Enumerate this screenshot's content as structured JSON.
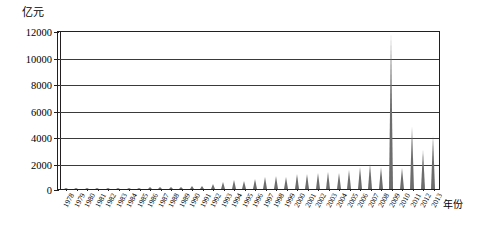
{
  "chart_data": {
    "type": "bar",
    "title": "",
    "xlabel": "年份",
    "ylabel": "亿元",
    "ylim": [
      0,
      12000
    ],
    "ytick_values": [
      0,
      2000,
      4000,
      6000,
      8000,
      10000,
      12000
    ],
    "ytick_labels": [
      "0",
      "2000",
      "4000",
      "6000",
      "8000",
      "10000",
      "12000"
    ],
    "grid": true,
    "legend": "none",
    "series_name": "",
    "bar_color": "#6d6d6d",
    "axis_color": "#231f20",
    "grid_color": "#3a3a3a",
    "categories": [
      "1978",
      "1979",
      "1980",
      "1981",
      "1982",
      "1983",
      "1984",
      "1985",
      "1986",
      "1987",
      "1988",
      "1989",
      "1990",
      "1991",
      "1992",
      "1993",
      "1994",
      "1995",
      "1996",
      "1997",
      "1998",
      "1999",
      "2000",
      "2001",
      "2002",
      "2003",
      "2004",
      "2005",
      "2006",
      "2007",
      "2008",
      "2009",
      "2010",
      "2011",
      "2012",
      "2013"
    ],
    "values": [
      30,
      40,
      50,
      55,
      65,
      80,
      110,
      140,
      160,
      185,
      210,
      200,
      230,
      300,
      430,
      600,
      700,
      620,
      780,
      950,
      1000,
      980,
      1150,
      1200,
      1280,
      1350,
      1250,
      1500,
      1700,
      1900,
      1700,
      11800,
      1600,
      4700,
      3000,
      4000
    ]
  }
}
